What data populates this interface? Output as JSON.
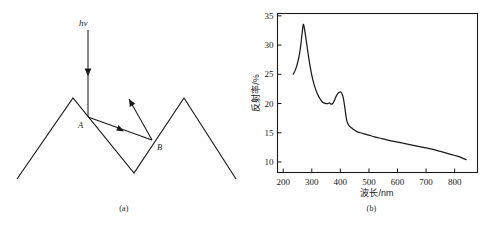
{
  "figure": {
    "panels": [
      {
        "id": "a",
        "caption": "(a)",
        "kind": "diagram"
      },
      {
        "id": "b",
        "caption": "(b)",
        "kind": "chart"
      }
    ]
  },
  "diagram": {
    "title_label": "hν",
    "point_a_label": "A",
    "point_b_label": "B",
    "surface_points": "17,179 73,98 134,173 184,98 236,179",
    "incident_ray": {
      "x1": 88,
      "y1": 30,
      "x2": 88,
      "y2": 117
    },
    "incident_arrow_at": {
      "x": 88,
      "y": 72
    },
    "ab_ray": {
      "x1": 88,
      "y1": 117,
      "x2": 152,
      "y2": 140
    },
    "ab_arrow_at": {
      "x": 120,
      "y": 129
    },
    "exit_ray": {
      "x1": 152,
      "y1": 140,
      "x2": 129,
      "y2": 99
    },
    "line_color": "#1a1a1a"
  },
  "chart_data": {
    "type": "line",
    "title": "",
    "xlabel": "波长/nm",
    "ylabel": "反射率/%",
    "xlim": [
      180,
      880
    ],
    "ylim": [
      8.2,
      35.4
    ],
    "xticks": [
      200,
      300,
      400,
      500,
      600,
      700,
      800
    ],
    "yticks": [
      10,
      15,
      20,
      25,
      30,
      35
    ],
    "xtick_labels": [
      "200",
      "300",
      "400",
      "500",
      "600",
      "700",
      "800"
    ],
    "ytick_labels": [
      "10",
      "15",
      "20",
      "25",
      "30",
      "35"
    ],
    "grid": false,
    "legend": "none",
    "series": [
      {
        "name": "reflectance",
        "color": "#1a1a1a",
        "x": [
          235,
          243,
          250,
          256,
          261,
          265,
          268,
          270,
          272,
          275,
          279,
          284,
          290,
          297,
          305,
          313,
          321,
          329,
          336,
          343,
          350,
          356,
          362,
          367,
          371,
          375,
          379,
          383,
          387,
          391,
          395,
          399,
          403,
          407,
          410,
          413,
          416,
          419,
          422,
          425,
          429,
          434,
          440,
          448,
          458,
          470,
          485,
          500,
          520,
          545,
          570,
          600,
          630,
          660,
          690,
          720,
          750,
          780,
          810,
          840
        ],
        "y": [
          25.0,
          25.8,
          26.9,
          28.2,
          29.8,
          31.5,
          32.8,
          33.5,
          33.4,
          32.6,
          31.3,
          29.6,
          27.6,
          25.6,
          23.8,
          22.5,
          21.5,
          20.8,
          20.3,
          20.1,
          20.0,
          20.0,
          20.1,
          19.9,
          19.9,
          20.1,
          20.5,
          21.0,
          21.4,
          21.7,
          21.9,
          22.0,
          21.9,
          21.5,
          21.0,
          20.2,
          19.2,
          18.1,
          17.2,
          16.7,
          16.3,
          16.0,
          15.8,
          15.5,
          15.2,
          15.0,
          14.8,
          14.6,
          14.3,
          14.0,
          13.7,
          13.4,
          13.1,
          12.8,
          12.5,
          12.2,
          11.8,
          11.4,
          11.0,
          10.4
        ]
      }
    ]
  }
}
